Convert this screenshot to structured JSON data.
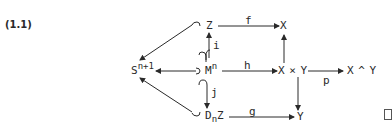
{
  "equation_number": "(1.1)",
  "nodes": {
    "sphere": {
      "base": "S",
      "sup": "n+1"
    },
    "Z": "Z",
    "X": "X",
    "manifold": {
      "base": "M",
      "sup": "n"
    },
    "product": "X × Y",
    "smash": "X ^ Y",
    "disk_bundle": {
      "base": "D",
      "sub": "n",
      "tail": "Z"
    },
    "Y": "Y"
  },
  "morphisms": {
    "f": "f",
    "h": "h",
    "g": "g",
    "i": "i",
    "j": "j",
    "p": "p"
  },
  "qed_symbol": "□",
  "colors": {
    "ink": "#2a2a2a",
    "background": "#ffffff"
  }
}
